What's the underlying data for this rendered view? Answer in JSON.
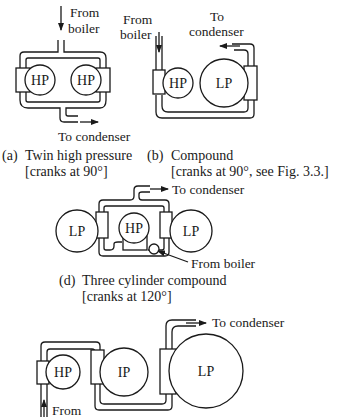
{
  "diagram": {
    "colors": {
      "ink": "#1a1a1a",
      "background": "#ffffff"
    },
    "panels": [
      {
        "id": "a",
        "cylinders": [
          "HP",
          "HP"
        ],
        "inlet_label": [
          "From",
          "boiler"
        ],
        "outlet_label": "To condenser",
        "caption_letter": "(a)",
        "caption_title": "Twin high pressure",
        "caption_note": "[cranks at 90°]"
      },
      {
        "id": "b",
        "cylinders": [
          "HP",
          "LP"
        ],
        "inlet_label": [
          "From",
          "boiler"
        ],
        "outlet_label": [
          "To",
          "condenser"
        ],
        "caption_letter": "(b)",
        "caption_title": "Compound",
        "caption_note": "[cranks at 90°, see Fig. 3.3.]"
      },
      {
        "id": "d",
        "cylinders": [
          "LP",
          "HP",
          "LP"
        ],
        "inlet_label": "From boiler",
        "outlet_label": "To condenser",
        "caption_letter": "(d)",
        "caption_title": "Three cylinder compound",
        "caption_note": "[cranks at 120°]"
      },
      {
        "id": "e",
        "cylinders": [
          "HP",
          "IP",
          "LP"
        ],
        "inlet_label": "From",
        "outlet_label": "To condenser"
      }
    ]
  }
}
